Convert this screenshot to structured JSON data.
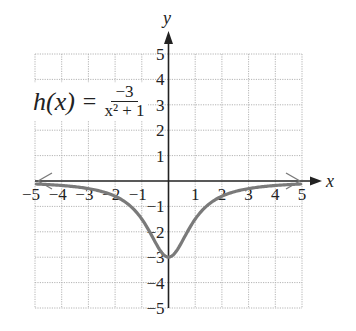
{
  "chart_data": {
    "type": "line",
    "title": "",
    "function_label": {
      "lhs": "h(x)",
      "equals": "=",
      "numerator": "−3",
      "denominator": "x² + 1"
    },
    "xlabel": "x",
    "ylabel": "y",
    "xlim": [
      -5,
      5
    ],
    "ylim": [
      -5,
      5
    ],
    "grid": true,
    "x_ticks": [
      "−5",
      "−4",
      "−3",
      "−2",
      "−1",
      "1",
      "2",
      "3",
      "4",
      "5"
    ],
    "y_ticks": [
      "5",
      "4",
      "3",
      "2",
      "1",
      "−1",
      "−2",
      "−3",
      "−4",
      "−5"
    ],
    "series": [
      {
        "name": "h(x) = -3/(x^2+1)",
        "x": [
          -5,
          -4,
          -3,
          -2,
          -1,
          -0.5,
          0,
          0.5,
          1,
          2,
          3,
          4,
          5
        ],
        "y": [
          -0.115,
          -0.176,
          -0.3,
          -0.6,
          -1.5,
          -2.4,
          -3,
          -2.4,
          -1.5,
          -0.6,
          -0.3,
          -0.176,
          -0.115
        ],
        "color": "#7a7a7a",
        "arrows_at_ends": true
      }
    ],
    "annotations": [
      "horizontal asymptote y = 0 approached at both ends (arrows)"
    ]
  }
}
